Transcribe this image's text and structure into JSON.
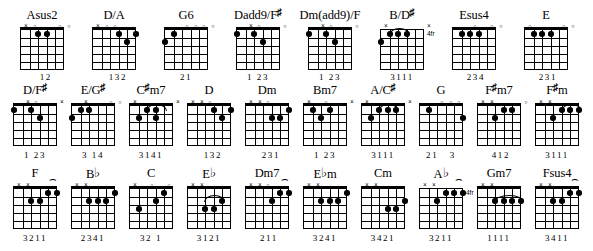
{
  "document": {
    "title": "Guitar Chord Chart",
    "rows": 3,
    "chords_per_row": 8,
    "strings": 6,
    "frets": 5
  },
  "glyphs": {
    "open": "○",
    "muted": "×",
    "sharp": "♯",
    "flat": "♭"
  },
  "rows": [
    {
      "chords": [
        {
          "name": "Asus2",
          "name_base": "Asus2",
          "accidental": "",
          "markers": [
            "x",
            "o",
            "",
            "",
            "o",
            "o"
          ],
          "dots": [
            {
              "string": 3,
              "fret": 1
            },
            {
              "string": 4,
              "fret": 1
            }
          ],
          "barres": [],
          "fret_label": "",
          "fingering": "  1 2  "
        },
        {
          "name": "D/A",
          "name_base": "D/A",
          "accidental": "",
          "markers": [
            "x",
            "o",
            "o",
            "",
            "",
            ""
          ],
          "dots": [
            {
              "string": 4,
              "fret": 1
            },
            {
              "string": 6,
              "fret": 1
            },
            {
              "string": 5,
              "fret": 2
            }
          ],
          "barres": [],
          "fret_label": "",
          "fingering": "  1 3 2"
        },
        {
          "name": "G6",
          "name_base": "G6",
          "accidental": "",
          "markers": [
            "",
            "",
            "o",
            "o",
            "o",
            "o"
          ],
          "dots": [
            {
              "string": 2,
              "fret": 1
            },
            {
              "string": 1,
              "fret": 2
            }
          ],
          "barres": [],
          "fret_label": "",
          "fingering": "2 1    "
        },
        {
          "name": "Dadd9/F#",
          "name_base": "Dadd9/F",
          "accidental": "♯",
          "markers": [
            "",
            "x",
            "o",
            "",
            "",
            "o"
          ],
          "dots": [
            {
              "string": 1,
              "fret": 1
            },
            {
              "string": 3,
              "fret": 1
            },
            {
              "string": 4,
              "fret": 2
            }
          ],
          "barres": [],
          "fret_label": "",
          "fingering": "1   2 3"
        },
        {
          "name": "Dm(add9)/F",
          "name_base": "Dm(add9)/F",
          "accidental": "",
          "markers": [
            "",
            "x",
            "o",
            "",
            "",
            "o"
          ],
          "dots": [
            {
              "string": 1,
              "fret": 1
            },
            {
              "string": 3,
              "fret": 1
            },
            {
              "string": 4,
              "fret": 2
            }
          ],
          "barres": [],
          "fret_label": "",
          "fingering": "1   2 3"
        },
        {
          "name": "B/D#",
          "name_base": "B/D",
          "accidental": "♯",
          "markers": [
            "x",
            "",
            "",
            "",
            "",
            "x"
          ],
          "dots": [
            {
              "string": 2,
              "fret": 1
            },
            {
              "string": 3,
              "fret": 1
            },
            {
              "string": 4,
              "fret": 1
            },
            {
              "string": 1,
              "fret": 2
            }
          ],
          "barres": [
            {
              "fret": 1,
              "from": 2,
              "to": 5
            }
          ],
          "fret_label": "4fr",
          "fingering": "3 1 1 1"
        },
        {
          "name": "Esus4",
          "name_base": "Esus4",
          "accidental": "",
          "markers": [
            "",
            "",
            "o",
            "",
            "o",
            "o"
          ],
          "dots": [
            {
              "string": 2,
              "fret": 1
            },
            {
              "string": 3,
              "fret": 1
            },
            {
              "string": 4,
              "fret": 1
            }
          ],
          "barres": [],
          "fret_label": "",
          "fingering": " 2 3 4 "
        },
        {
          "name": "E",
          "name_base": "E",
          "accidental": "",
          "markers": [
            "o",
            "",
            "",
            "",
            "o",
            "o"
          ],
          "dots": [
            {
              "string": 2,
              "fret": 1
            },
            {
              "string": 3,
              "fret": 1
            },
            {
              "string": 4,
              "fret": 1
            }
          ],
          "barres": [],
          "fret_label": "",
          "fingering": " 2 3 1 "
        }
      ]
    },
    {
      "chords": [
        {
          "name": "D/F#",
          "name_base": "D/F",
          "accidental": "♯",
          "markers": [
            "",
            "x",
            "o",
            "",
            "",
            "x"
          ],
          "dots": [
            {
              "string": 1,
              "fret": 1
            },
            {
              "string": 3,
              "fret": 1
            },
            {
              "string": 4,
              "fret": 2
            }
          ],
          "barres": [],
          "fret_label": "",
          "fingering": "1   2 3"
        },
        {
          "name": "E/G#",
          "name_base": "E/G",
          "accidental": "♯",
          "markers": [
            "",
            "x",
            "",
            "",
            "o",
            "o"
          ],
          "dots": [
            {
              "string": 2,
              "fret": 1
            },
            {
              "string": 3,
              "fret": 1
            },
            {
              "string": 1,
              "fret": 2
            }
          ],
          "barres": [],
          "fret_label": "",
          "fingering": "3  1 4 "
        },
        {
          "name": "C#m7",
          "name_base": "C",
          "accidental": "♯",
          "name_tail": "m7",
          "markers": [
            "x",
            "",
            "",
            "",
            "",
            "x"
          ],
          "dots": [
            {
              "string": 2,
              "fret": 1
            },
            {
              "string": 3,
              "fret": 1
            },
            {
              "string": 4,
              "fret": 1
            },
            {
              "string": 1,
              "fret": 2
            },
            {
              "string": 3,
              "fret": 2
            }
          ],
          "barres": [
            {
              "fret": 1,
              "from": 2,
              "to": 4
            }
          ],
          "fret_label": "",
          "fingering": "3 1 4 1"
        },
        {
          "name": "D",
          "name_base": "D",
          "accidental": "",
          "markers": [
            "x",
            "x",
            "o",
            "",
            "",
            ""
          ],
          "dots": [
            {
              "string": 4,
              "fret": 1
            },
            {
              "string": 6,
              "fret": 1
            },
            {
              "string": 5,
              "fret": 2
            }
          ],
          "barres": [],
          "fret_label": "",
          "fingering": "  1 3 2"
        },
        {
          "name": "Dm",
          "name_base": "Dm",
          "accidental": "",
          "markers": [
            "x",
            "x",
            "o",
            "",
            "",
            ""
          ],
          "dots": [
            {
              "string": 6,
              "fret": 1
            },
            {
              "string": 4,
              "fret": 2
            },
            {
              "string": 5,
              "fret": 2
            }
          ],
          "barres": [],
          "fret_label": "",
          "fingering": "  2 3 1"
        },
        {
          "name": "Bm7",
          "name_base": "Bm7",
          "accidental": "",
          "markers": [
            "x",
            "",
            "o",
            "",
            "",
            "x"
          ],
          "dots": [
            {
              "string": 2,
              "fret": 1
            },
            {
              "string": 4,
              "fret": 1
            },
            {
              "string": 3,
              "fret": 2
            }
          ],
          "barres": [],
          "fret_label": "",
          "fingering": "1   2 3"
        },
        {
          "name": "A/C#",
          "name_base": "A/C",
          "accidental": "♯",
          "markers": [
            "x",
            "",
            "",
            "",
            "",
            "x"
          ],
          "dots": [
            {
              "string": 3,
              "fret": 1
            },
            {
              "string": 4,
              "fret": 1
            },
            {
              "string": 5,
              "fret": 1
            },
            {
              "string": 2,
              "fret": 2
            }
          ],
          "barres": [
            {
              "fret": 1,
              "from": 3,
              "to": 5
            }
          ],
          "fret_label": "",
          "fingering": "3 1 1 1"
        },
        {
          "name": "G",
          "name_base": "G",
          "accidental": "",
          "markers": [
            "",
            "",
            "o",
            "o",
            "o",
            ""
          ],
          "dots": [
            {
              "string": 2,
              "fret": 1
            },
            {
              "string": 6,
              "fret": 2
            }
          ],
          "barres": [],
          "fret_label": "",
          "fingering": "2 1    3"
        }
      ]
    },
    {
      "chords": [
        {
          "name": "F#m7",
          "name_base": "F",
          "accidental": "♯",
          "name_tail": "m7",
          "markers": [
            "x",
            "x",
            "",
            "",
            "",
            "o"
          ],
          "dots": [
            {
              "string": 4,
              "fret": 1
            },
            {
              "string": 5,
              "fret": 1
            },
            {
              "string": 3,
              "fret": 2
            }
          ],
          "barres": [],
          "fret_label": "",
          "fingering": " 4 1 2 "
        },
        {
          "name": "F#m",
          "name_base": "F",
          "accidental": "♯",
          "name_tail": "m",
          "markers": [
            "x",
            "x",
            "",
            "",
            "",
            ""
          ],
          "dots": [
            {
              "string": 4,
              "fret": 1
            },
            {
              "string": 5,
              "fret": 1
            },
            {
              "string": 6,
              "fret": 1
            },
            {
              "string": 3,
              "fret": 2
            }
          ],
          "barres": [
            {
              "fret": 1,
              "from": 4,
              "to": 6
            }
          ],
          "fret_label": "",
          "fingering": "3 1 1 1"
        },
        {
          "name": "F",
          "name_base": "F",
          "accidental": "",
          "markers": [
            "x",
            "x",
            "",
            "",
            "^",
            ""
          ],
          "dots": [
            {
              "string": 5,
              "fret": 1
            },
            {
              "string": 6,
              "fret": 1
            },
            {
              "string": 4,
              "fret": 2
            },
            {
              "string": 3,
              "fret": 3
            }
          ],
          "barres": [],
          "fret_label": "",
          "fingering": "3 2 1 1"
        },
        {
          "name": "Bb",
          "name_base": "B",
          "accidental": "♭",
          "markers": [
            "x",
            "x",
            "",
            "",
            "",
            ""
          ],
          "dots": [
            {
              "string": 6,
              "fret": 1
            },
            {
              "string": 3,
              "fret": 2
            },
            {
              "string": 4,
              "fret": 2
            },
            {
              "string": 5,
              "fret": 2
            }
          ],
          "barres": [],
          "fret_label": "",
          "fingering": "2 3 4 1"
        },
        {
          "name": "C",
          "name_base": "C",
          "accidental": "",
          "markers": [
            "x",
            "",
            "o",
            "",
            "o",
            ""
          ],
          "dots": [
            {
              "string": 5,
              "fret": 1
            },
            {
              "string": 4,
              "fret": 2
            },
            {
              "string": 2,
              "fret": 3
            }
          ],
          "barres": [],
          "fret_label": "",
          "fingering": "3 2   1"
        },
        {
          "name": "Eb",
          "name_base": "E",
          "accidental": "♭",
          "markers": [
            "x",
            "x",
            "",
            "",
            "",
            ""
          ],
          "dots": [
            {
              "string": 5,
              "fret": 2
            },
            {
              "string": 4,
              "fret": 3
            },
            {
              "string": 3,
              "fret": 4
            }
          ],
          "barres": [
            {
              "fret": 1,
              "from": 3,
              "to": 5
            }
          ],
          "fret_label": "",
          "fingering": "3 1 2 1"
        },
        {
          "name": "Dm7",
          "name_base": "Dm7",
          "accidental": "",
          "markers": [
            "x",
            "x",
            "o",
            "",
            "^",
            ""
          ],
          "dots": [
            {
              "string": 5,
              "fret": 1
            },
            {
              "string": 6,
              "fret": 1
            },
            {
              "string": 4,
              "fret": 2
            }
          ],
          "barres": [],
          "fret_label": "",
          "fingering": " 2 1 1 "
        },
        {
          "name": "Ebm",
          "name_base": "E",
          "accidental": "♭",
          "name_tail": "m",
          "markers": [
            "x",
            "x",
            "",
            "",
            "",
            ""
          ],
          "dots": [
            {
              "string": 6,
              "fret": 1
            },
            {
              "string": 4,
              "fret": 2
            },
            {
              "string": 5,
              "fret": 2
            },
            {
              "string": 3,
              "fret": 2
            }
          ],
          "barres": [],
          "fret_label": "",
          "fingering": "3 2 4 1"
        }
      ]
    },
    {
      "chords": []
    }
  ],
  "row3": {
    "chords": [
      {
        "name": "F",
        "name_base": "F",
        "accidental": "",
        "markers": [
          "x",
          "x",
          "",
          "",
          "^",
          ""
        ],
        "dots": [
          {
            "string": 4,
            "fret": 2
          },
          {
            "string": 5,
            "fret": 1
          },
          {
            "string": 6,
            "fret": 1
          },
          {
            "string": 3,
            "fret": 2
          }
        ],
        "barres": [],
        "fret_label": "",
        "fingering": "3 2 1 1"
      }
    ]
  },
  "chart_data": {
    "type": "table"
  }
}
